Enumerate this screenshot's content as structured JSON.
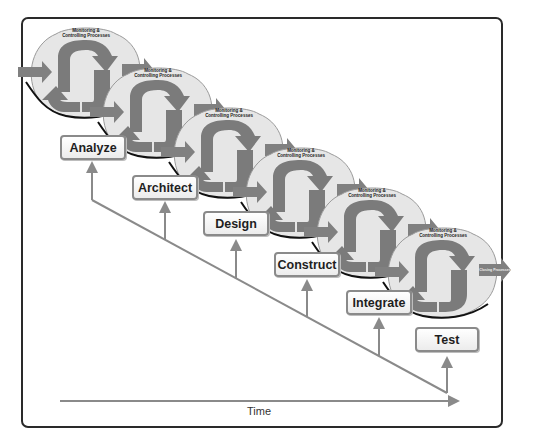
{
  "diagram": {
    "title": "",
    "process_groups": {
      "monitoring": "Monitoring & Controlling Processes",
      "monitoring_line1": "Monitoring &",
      "monitoring_line2": "Controlling Processes",
      "initiating": "Initiating Processes",
      "planning": "Planning Processes",
      "executing": "Executing Processes",
      "closing": "Closing Processes"
    },
    "phases": [
      {
        "label": "Analyze"
      },
      {
        "label": "Architect"
      },
      {
        "label": "Design"
      },
      {
        "label": "Construct"
      },
      {
        "label": "Integrate"
      },
      {
        "label": "Test"
      }
    ],
    "axis": {
      "label": "Time"
    },
    "colors": {
      "cycle_fill": "#e4e4e4",
      "arrow_fill": "#7d7d7d",
      "connector": "#8a8a8a",
      "frame": "#2a2a2a"
    }
  }
}
